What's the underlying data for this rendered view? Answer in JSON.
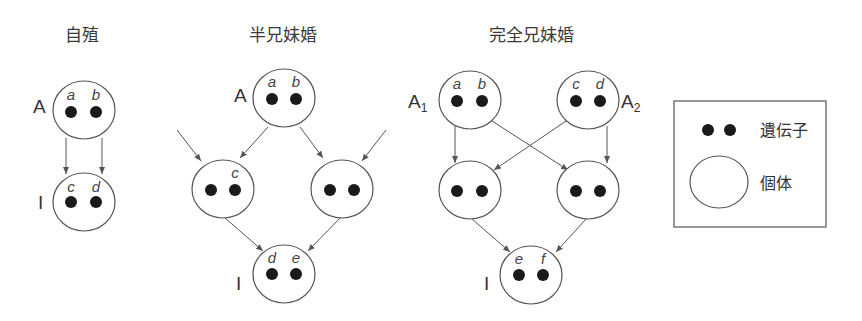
{
  "panels": {
    "selfing": {
      "title": "自殖",
      "parent_label": "A",
      "offspring_label": "I",
      "parent_genes": [
        "a",
        "b"
      ],
      "offspring_genes": [
        "c",
        "d"
      ]
    },
    "half_sib": {
      "title": "半兄妹婚",
      "parent_label": "A",
      "offspring_label": "I",
      "parent_genes": [
        "a",
        "b"
      ],
      "mid_left_gene": "c",
      "offspring_genes": [
        "d",
        "e"
      ]
    },
    "full_sib": {
      "title": "完全兄妹婚",
      "parent1_label": "A",
      "parent1_sub": "1",
      "parent2_label": "A",
      "parent2_sub": "2",
      "offspring_label": "I",
      "parent1_genes": [
        "a",
        "b"
      ],
      "parent2_genes": [
        "c",
        "d"
      ],
      "offspring_genes": [
        "e",
        "f"
      ]
    }
  },
  "legend": {
    "gene_label": "遺伝子",
    "individual_label": "個体"
  }
}
